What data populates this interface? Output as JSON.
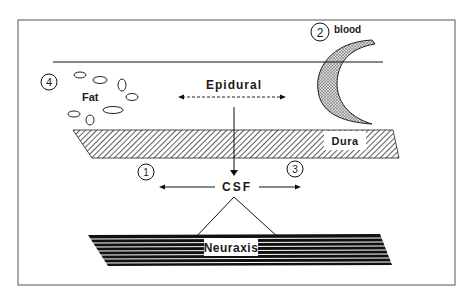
{
  "diagram": {
    "labels": {
      "epidural": "Epidural",
      "fat": "Fat",
      "dura": "Dura",
      "csf": "CSF",
      "neuraxis": "Neuraxis",
      "blood": "blood"
    },
    "markers": [
      {
        "id": "1",
        "label": "1"
      },
      {
        "id": "2",
        "label": "2"
      },
      {
        "id": "3",
        "label": "3"
      },
      {
        "id": "4",
        "label": "4"
      }
    ]
  }
}
